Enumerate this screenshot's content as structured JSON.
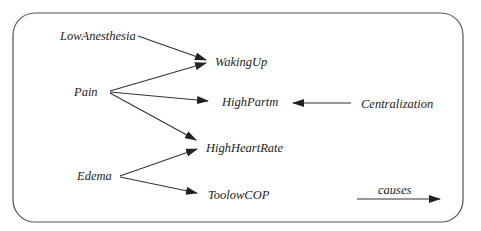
{
  "diagram": {
    "type": "causal-graph",
    "nodes": {
      "low_anesthesia": "LowAnesthesia",
      "pain": "Pain",
      "edema": "Edema",
      "waking_up": "WakingUp",
      "high_partm": "HighPartm",
      "high_heart_rate": "HighHeartRate",
      "toolow_cop": "ToolowCOP",
      "centralization": "Centralization"
    },
    "edges": [
      {
        "from": "LowAnesthesia",
        "to": "WakingUp"
      },
      {
        "from": "Pain",
        "to": "WakingUp"
      },
      {
        "from": "Pain",
        "to": "HighPartm"
      },
      {
        "from": "Pain",
        "to": "HighHeartRate"
      },
      {
        "from": "Centralization",
        "to": "HighPartm"
      },
      {
        "from": "Edema",
        "to": "HighHeartRate"
      },
      {
        "from": "Edema",
        "to": "ToolowCOP"
      }
    ],
    "legend": {
      "label": "causes"
    },
    "colors": {
      "text": "#222222",
      "edge": "#333333",
      "frame": "#555555"
    }
  }
}
